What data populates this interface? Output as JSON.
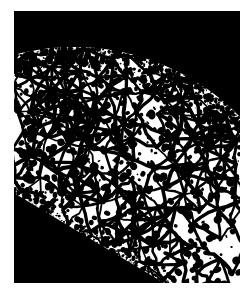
{
  "figure": {
    "type": "micrograph",
    "caption": "",
    "colors": {
      "background": "#ffffff",
      "matrix": "#ffffff",
      "features": "#000000",
      "mount": "#000000",
      "page": "#ffffff"
    },
    "frame": {
      "left": 14,
      "top": 11,
      "width": 226,
      "height": 272
    },
    "regions": [
      {
        "name": "upper-right-dark-band",
        "description": "solid black curved band occupying the upper right, bounded below by a convex arc running from the upper left edge down to the right edge",
        "shade": "black",
        "arc": {
          "center_x": 60,
          "center_y": 268,
          "radius": 232,
          "start_x": 0,
          "start_y": 34,
          "end_x": 226,
          "end_y": 120
        }
      },
      {
        "name": "lower-left-dark-wedge",
        "description": "solid black triangular wedge in the lower left corner bounded above by a straight diagonal edge",
        "shade": "black",
        "edge": {
          "start_x": 0,
          "start_y": 182,
          "end_x": 150,
          "end_y": 272
        }
      },
      {
        "name": "central-grain-field",
        "description": "white matrix grains separated by dark grain-boundary network with scattered dark precipitate particles",
        "shade": "white-with-black-network"
      },
      {
        "name": "upper-transition-band",
        "description": "dense speckled stippled band along the arc where the etched structure meets the black mount",
        "shade": "dense-speckle"
      },
      {
        "name": "lower-transition-band",
        "description": "dense speckled stippled band along the lower-left diagonal edge",
        "shade": "dense-speckle"
      }
    ],
    "texture": {
      "grain_boundary_count": 120,
      "precipitate_count": 900,
      "grain_mean_diameter_px": 26,
      "precipitate_mean_diameter_px": 4,
      "boundary_stroke_px": 3,
      "seed": 20240517,
      "precipitate_density_top_left": 1.45,
      "precipitate_density_bottom_right": 0.55
    }
  }
}
